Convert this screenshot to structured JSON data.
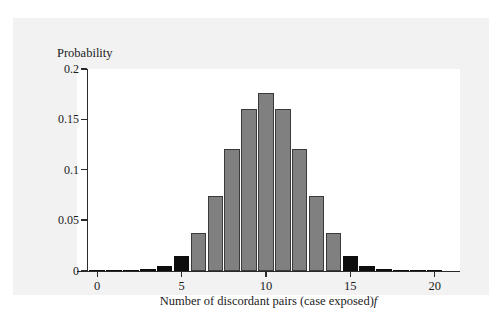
{
  "figure": {
    "y_axis_title": "Probability",
    "x_axis_title_main": "Number of discordant pairs (case exposed)",
    "x_axis_title_italic": "f"
  },
  "colors": {
    "page_background": "#ffffff",
    "panel_background": "#f2f2f2",
    "plot_background": "#ffffff",
    "axis": "#2a2a2a",
    "bar_normal": "#808080",
    "bar_highlight": "#0d0d0d",
    "bar_outline": "#3a3a3a",
    "text": "#1b1b1b"
  },
  "chart_data": {
    "type": "bar",
    "title": "",
    "subtitle": "",
    "xlabel": "Number of discordant pairs (case exposed) f",
    "ylabel": "Probability",
    "xlim": [
      -1.2,
      21.5
    ],
    "ylim": [
      0,
      0.2
    ],
    "grid": false,
    "legend": null,
    "x_ticks": [
      0,
      5,
      10,
      15,
      20
    ],
    "x_tick_labels": [
      "0",
      "5",
      "10",
      "15",
      "20"
    ],
    "y_ticks": [
      0,
      0.05,
      0.1,
      0.15,
      0.2
    ],
    "y_tick_labels": [
      "0",
      "0.05",
      "0.1",
      "0.15",
      "0.2"
    ],
    "categories": [
      0,
      1,
      2,
      3,
      4,
      5,
      6,
      7,
      8,
      9,
      10,
      11,
      12,
      13,
      14,
      15,
      16,
      17,
      18,
      19,
      20
    ],
    "values": [
      9.5e-07,
      1.91e-05,
      0.000181,
      0.001087,
      0.004621,
      0.014786,
      0.036964,
      0.073929,
      0.120134,
      0.160179,
      0.176197,
      0.160179,
      0.120134,
      0.073929,
      0.036964,
      0.014786,
      0.004621,
      0.001087,
      0.000181,
      1.91e-05,
      9.5e-07
    ],
    "highlighted": [
      0,
      1,
      2,
      3,
      4,
      5,
      15,
      16,
      17,
      18,
      19,
      20
    ],
    "annotations": []
  }
}
